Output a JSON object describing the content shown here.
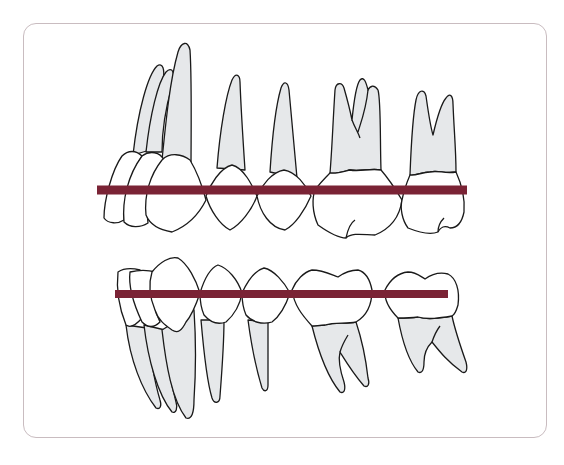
{
  "diagram": {
    "title": "",
    "colors": {
      "occlusal_line": "#7a2335",
      "root_fill": "#e6e8ea",
      "crown_fill": "#ffffff",
      "frame_border": "#c9bcc0",
      "outline": "#1a1a1a"
    },
    "arches": [
      {
        "name": "upper-arch",
        "teeth": [
          "central-incisor",
          "lateral-incisor",
          "canine",
          "first-premolar",
          "second-premolar",
          "first-molar",
          "second-molar"
        ],
        "occlusal_line": {
          "x1": 97,
          "x2": 467,
          "y": 190
        }
      },
      {
        "name": "lower-arch",
        "teeth": [
          "central-incisor",
          "lateral-incisor",
          "canine",
          "first-premolar",
          "second-premolar",
          "first-molar",
          "second-molar"
        ],
        "occlusal_line": {
          "x1": 115,
          "x2": 448,
          "y": 294
        }
      }
    ]
  }
}
